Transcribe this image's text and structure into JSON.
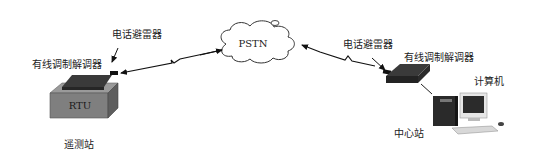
{
  "diagram": {
    "type": "network-topology",
    "network": {
      "label": "PSTN"
    },
    "remote_station": {
      "label": "遥测站",
      "device_label": "RTU",
      "modem_label": "有线调制解调器",
      "arrester_label": "电话避雷器"
    },
    "center_station": {
      "label": "中心站",
      "modem_label": "有线调制解调器",
      "arrester_label": "电话避雷器",
      "computer_label": "计算机"
    },
    "colors": {
      "line": "#111111",
      "rtu_top": "#8c8c8c",
      "rtu_front": "#7a7a7a",
      "rtu_side": "#5e5e5e",
      "modem": "#2e2e2e",
      "background": "#ffffff"
    }
  }
}
